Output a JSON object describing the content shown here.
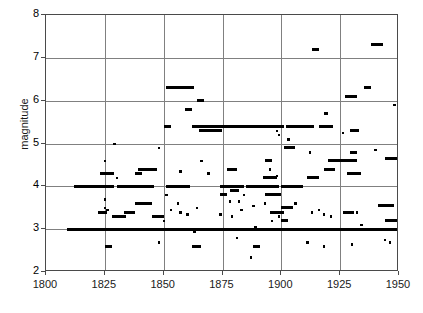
{
  "chart_data": {
    "type": "scatter",
    "title": "",
    "xlabel": "",
    "ylabel": "magnitude",
    "xlim": [
      1800,
      1950
    ],
    "ylim": [
      2,
      8
    ],
    "xticks": [
      1800,
      1825,
      1850,
      1875,
      1900,
      1925,
      1950
    ],
    "yticks": [
      2,
      3,
      4,
      5,
      6,
      7,
      8
    ],
    "xtick_labels": [
      "1800",
      "1825",
      "1850",
      "1875",
      "1900",
      "1925",
      "1950"
    ],
    "ytick_labels": [
      "2",
      "3",
      "4",
      "5",
      "6",
      "7",
      "8"
    ],
    "grid": true,
    "legend": null,
    "marker_color": "#000000",
    "grid_color": "#808080",
    "axis_color": "#4a4a4a",
    "segments": [
      {
        "y": 3.0,
        "x0": 1809,
        "x1": 1950
      },
      {
        "y": 3.0,
        "x0": 1810,
        "x1": 1949
      },
      {
        "y": 4.0,
        "x0": 1812,
        "x1": 1829
      },
      {
        "y": 4.0,
        "x0": 1830,
        "x1": 1846
      },
      {
        "y": 4.0,
        "x0": 1851,
        "x1": 1861
      },
      {
        "y": 4.0,
        "x0": 1874,
        "x1": 1884
      },
      {
        "y": 4.0,
        "x0": 1885,
        "x1": 1899
      },
      {
        "y": 4.0,
        "x0": 1900,
        "x1": 1909
      },
      {
        "y": 5.4,
        "x0": 1862,
        "x1": 1901
      },
      {
        "y": 5.4,
        "x0": 1902,
        "x1": 1914
      },
      {
        "y": 5.4,
        "x0": 1916,
        "x1": 1922
      },
      {
        "y": 5.3,
        "x0": 1865,
        "x1": 1875
      },
      {
        "y": 6.3,
        "x0": 1851,
        "x1": 1863
      },
      {
        "y": 4.4,
        "x0": 1839,
        "x1": 1847
      },
      {
        "y": 4.3,
        "x0": 1823,
        "x1": 1829
      },
      {
        "y": 4.6,
        "x0": 1920,
        "x1": 1932
      },
      {
        "y": 3.6,
        "x0": 1838,
        "x1": 1845
      },
      {
        "y": 3.4,
        "x0": 1822,
        "x1": 1826
      },
      {
        "y": 3.4,
        "x0": 1833,
        "x1": 1838
      },
      {
        "y": 3.55,
        "x0": 1941,
        "x1": 1948
      },
      {
        "y": 3.8,
        "x0": 1893,
        "x1": 1900
      },
      {
        "y": 4.9,
        "x0": 1901,
        "x1": 1906
      },
      {
        "y": 7.3,
        "x0": 1938,
        "x1": 1943
      },
      {
        "y": 7.2,
        "x0": 1913,
        "x1": 1916
      },
      {
        "y": 6.1,
        "x0": 1927,
        "x1": 1932
      },
      {
        "y": 6.0,
        "x0": 1864,
        "x1": 1867
      },
      {
        "y": 5.8,
        "x0": 1859,
        "x1": 1862
      },
      {
        "y": 5.4,
        "x0": 1850,
        "x1": 1853
      },
      {
        "y": 4.4,
        "x0": 1877,
        "x1": 1881
      },
      {
        "y": 4.2,
        "x0": 1892,
        "x1": 1898
      },
      {
        "y": 4.4,
        "x0": 1918,
        "x1": 1923
      },
      {
        "y": 4.3,
        "x0": 1928,
        "x1": 1934
      },
      {
        "y": 4.2,
        "x0": 1911,
        "x1": 1916
      },
      {
        "y": 4.3,
        "x0": 1838,
        "x1": 1841
      },
      {
        "y": 3.3,
        "x0": 1828,
        "x1": 1834
      },
      {
        "y": 3.4,
        "x0": 1926,
        "x1": 1931
      },
      {
        "y": 3.3,
        "x0": 1845,
        "x1": 1850
      },
      {
        "y": 2.6,
        "x0": 1825,
        "x1": 1828
      },
      {
        "y": 2.6,
        "x0": 1862,
        "x1": 1866
      },
      {
        "y": 5.3,
        "x0": 1929,
        "x1": 1933
      },
      {
        "y": 4.65,
        "x0": 1944,
        "x1": 1950
      },
      {
        "y": 6.3,
        "x0": 1935,
        "x1": 1938
      },
      {
        "y": 5.7,
        "x0": 1918,
        "x1": 1920
      },
      {
        "y": 4.8,
        "x0": 1929,
        "x1": 1932
      },
      {
        "y": 3.9,
        "x0": 1878,
        "x1": 1882
      },
      {
        "y": 3.4,
        "x0": 1895,
        "x1": 1901
      },
      {
        "y": 3.5,
        "x0": 1900,
        "x1": 1905
      },
      {
        "y": 4.6,
        "x0": 1893,
        "x1": 1896
      },
      {
        "y": 3.8,
        "x0": 1874,
        "x1": 1877
      },
      {
        "y": 3.2,
        "x0": 1900,
        "x1": 1903
      },
      {
        "y": 2.6,
        "x0": 1888,
        "x1": 1891
      },
      {
        "y": 3.2,
        "x0": 1944,
        "x1": 1949
      }
    ],
    "points": [
      {
        "x": 1829,
        "y": 5.0
      },
      {
        "x": 1848,
        "y": 4.9
      },
      {
        "x": 1825,
        "y": 4.6
      },
      {
        "x": 1830,
        "y": 4.2
      },
      {
        "x": 1857,
        "y": 4.35
      },
      {
        "x": 1866,
        "y": 4.6
      },
      {
        "x": 1869,
        "y": 4.3
      },
      {
        "x": 1855,
        "y": 4.0
      },
      {
        "x": 1860,
        "y": 4.0
      },
      {
        "x": 1825,
        "y": 3.7
      },
      {
        "x": 1825,
        "y": 3.5
      },
      {
        "x": 1826,
        "y": 3.45
      },
      {
        "x": 1851,
        "y": 3.8
      },
      {
        "x": 1856,
        "y": 3.6
      },
      {
        "x": 1864,
        "y": 3.5
      },
      {
        "x": 1853,
        "y": 3.45
      },
      {
        "x": 1857,
        "y": 3.4
      },
      {
        "x": 1860,
        "y": 3.35
      },
      {
        "x": 1850,
        "y": 3.2
      },
      {
        "x": 1863,
        "y": 2.95
      },
      {
        "x": 1848,
        "y": 2.7
      },
      {
        "x": 1878,
        "y": 3.65
      },
      {
        "x": 1882,
        "y": 3.65
      },
      {
        "x": 1884,
        "y": 3.8
      },
      {
        "x": 1888,
        "y": 3.55
      },
      {
        "x": 1874,
        "y": 3.35
      },
      {
        "x": 1879,
        "y": 3.3
      },
      {
        "x": 1883,
        "y": 3.45
      },
      {
        "x": 1881,
        "y": 2.8
      },
      {
        "x": 1887,
        "y": 2.35
      },
      {
        "x": 1893,
        "y": 3.6
      },
      {
        "x": 1896,
        "y": 3.2
      },
      {
        "x": 1899,
        "y": 3.3
      },
      {
        "x": 1902,
        "y": 3.2
      },
      {
        "x": 1906,
        "y": 3.6
      },
      {
        "x": 1899,
        "y": 5.2
      },
      {
        "x": 1898,
        "y": 5.3
      },
      {
        "x": 1903,
        "y": 5.1
      },
      {
        "x": 1912,
        "y": 4.8
      },
      {
        "x": 1916,
        "y": 3.45
      },
      {
        "x": 1918,
        "y": 3.35
      },
      {
        "x": 1921,
        "y": 3.3
      },
      {
        "x": 1913,
        "y": 3.4
      },
      {
        "x": 1911,
        "y": 2.7
      },
      {
        "x": 1918,
        "y": 2.6
      },
      {
        "x": 1932,
        "y": 3.4
      },
      {
        "x": 1934,
        "y": 3.1
      },
      {
        "x": 1937,
        "y": 3.0
      },
      {
        "x": 1940,
        "y": 4.85
      },
      {
        "x": 1946,
        "y": 2.7
      },
      {
        "x": 1944,
        "y": 2.75
      },
      {
        "x": 1948,
        "y": 5.9
      },
      {
        "x": 1926,
        "y": 5.25
      },
      {
        "x": 1930,
        "y": 2.65
      },
      {
        "x": 1889,
        "y": 3.05
      },
      {
        "x": 1895,
        "y": 4.4
      },
      {
        "x": 1898,
        "y": 4.25
      }
    ]
  }
}
